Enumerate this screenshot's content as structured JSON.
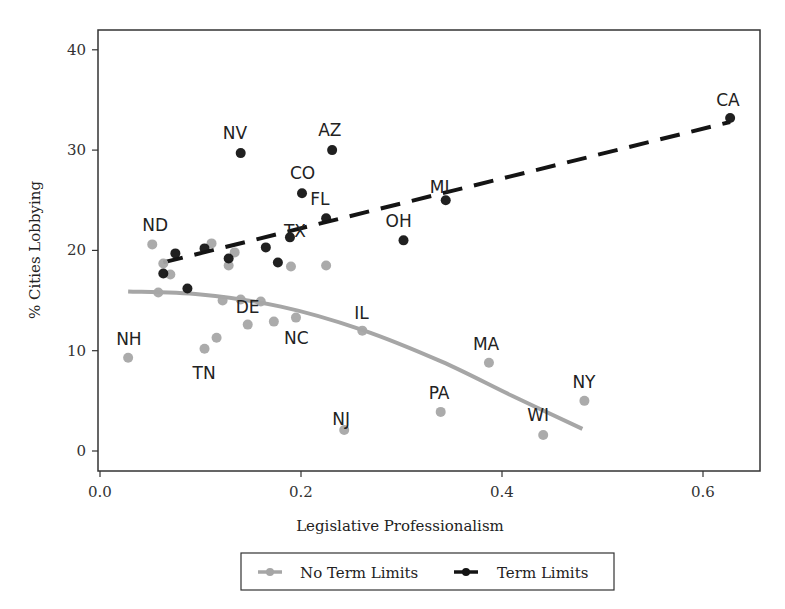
{
  "chart_data": {
    "type": "scatter",
    "title": "",
    "xlabel": "Legislative Professionalism",
    "ylabel": "% Cities Lobbying",
    "xlim": [
      -0.002,
      0.658
    ],
    "ylim": [
      -2,
      42
    ],
    "xticks": [
      0.0,
      0.2,
      0.4,
      0.6
    ],
    "xtick_labels": [
      "0.0",
      "0.2",
      "0.4",
      "0.6"
    ],
    "yticks": [
      0,
      10,
      20,
      30,
      40
    ],
    "ytick_labels": [
      "0",
      "10",
      "20",
      "30",
      "40"
    ],
    "grid": false,
    "legend_position": "bottom",
    "series": [
      {
        "name": "No Term Limits",
        "color": "#a6a6a6",
        "points": [
          {
            "x": 0.052,
            "y": 20.6,
            "label": "ND"
          },
          {
            "x": 0.063,
            "y": 18.7,
            "label": ""
          },
          {
            "x": 0.07,
            "y": 17.6,
            "label": ""
          },
          {
            "x": 0.058,
            "y": 15.8,
            "label": ""
          },
          {
            "x": 0.111,
            "y": 20.7,
            "label": ""
          },
          {
            "x": 0.134,
            "y": 19.8,
            "label": ""
          },
          {
            "x": 0.128,
            "y": 18.5,
            "label": ""
          },
          {
            "x": 0.19,
            "y": 18.4,
            "label": ""
          },
          {
            "x": 0.225,
            "y": 18.5,
            "label": ""
          },
          {
            "x": 0.122,
            "y": 15.0,
            "label": ""
          },
          {
            "x": 0.14,
            "y": 15.1,
            "label": ""
          },
          {
            "x": 0.16,
            "y": 14.9,
            "label": ""
          },
          {
            "x": 0.147,
            "y": 12.6,
            "label": "DE"
          },
          {
            "x": 0.173,
            "y": 12.9,
            "label": ""
          },
          {
            "x": 0.195,
            "y": 13.3,
            "label": "NC"
          },
          {
            "x": 0.116,
            "y": 11.3,
            "label": ""
          },
          {
            "x": 0.104,
            "y": 10.2,
            "label": "TN"
          },
          {
            "x": 0.028,
            "y": 9.3,
            "label": "NH"
          },
          {
            "x": 0.261,
            "y": 12.0,
            "label": "IL"
          },
          {
            "x": 0.387,
            "y": 8.8,
            "label": "MA"
          },
          {
            "x": 0.339,
            "y": 3.9,
            "label": "PA"
          },
          {
            "x": 0.243,
            "y": 2.1,
            "label": "NJ"
          },
          {
            "x": 0.482,
            "y": 5.0,
            "label": "NY"
          },
          {
            "x": 0.441,
            "y": 1.6,
            "label": "WI"
          }
        ],
        "fit": {
          "type": "quadratic",
          "style": "solid",
          "width": 4,
          "points": [
            [
              0.028,
              15.9
            ],
            [
              0.1,
              15.6
            ],
            [
              0.18,
              14.4
            ],
            [
              0.26,
              12.1
            ],
            [
              0.34,
              8.9
            ],
            [
              0.41,
              5.5
            ],
            [
              0.48,
              2.2
            ]
          ]
        }
      },
      {
        "name": "Term Limits",
        "color": "#141414",
        "points": [
          {
            "x": 0.627,
            "y": 33.2,
            "label": "CA"
          },
          {
            "x": 0.14,
            "y": 29.7,
            "label": "NV"
          },
          {
            "x": 0.231,
            "y": 30.0,
            "label": "AZ"
          },
          {
            "x": 0.201,
            "y": 25.7,
            "label": "CO"
          },
          {
            "x": 0.225,
            "y": 23.2,
            "label": "FL"
          },
          {
            "x": 0.344,
            "y": 25.0,
            "label": "MI"
          },
          {
            "x": 0.302,
            "y": 21.0,
            "label": "OH"
          },
          {
            "x": 0.189,
            "y": 21.3,
            "label": "TX"
          },
          {
            "x": 0.075,
            "y": 19.7,
            "label": ""
          },
          {
            "x": 0.063,
            "y": 17.7,
            "label": ""
          },
          {
            "x": 0.087,
            "y": 16.2,
            "label": ""
          },
          {
            "x": 0.104,
            "y": 20.2,
            "label": ""
          },
          {
            "x": 0.128,
            "y": 19.2,
            "label": ""
          },
          {
            "x": 0.165,
            "y": 20.3,
            "label": ""
          },
          {
            "x": 0.177,
            "y": 18.8,
            "label": ""
          }
        ],
        "fit": {
          "type": "linear",
          "style": "dashed",
          "width": 4,
          "points": [
            [
              0.063,
              18.8
            ],
            [
              0.627,
              32.8
            ]
          ]
        }
      }
    ],
    "label_offsets": {
      "ND": [
        -2,
        -13
      ],
      "DE": [
        -4,
        -12
      ],
      "NC": [
        -4,
        26
      ],
      "TN": [
        -4,
        30
      ],
      "NH": [
        -4,
        -13
      ],
      "IL": [
        0,
        -12
      ],
      "MA": [
        -8,
        -13
      ],
      "PA": [
        -4,
        -13
      ],
      "NJ": [
        -4,
        -5
      ],
      "NY": [
        -4,
        -13
      ],
      "WI": [
        -8,
        -14
      ],
      "CA": [
        -6,
        -12
      ],
      "NV": [
        -10,
        -14
      ],
      "AZ": [
        -6,
        -14
      ],
      "CO": [
        -4,
        -14
      ],
      "FL": [
        -8,
        -13
      ],
      "MI": [
        -8,
        -7
      ],
      "OH": [
        -10,
        -13
      ],
      "TX": [
        2,
        0
      ]
    }
  },
  "legend": {
    "items": [
      {
        "label": "No Term Limits",
        "color": "#a6a6a6"
      },
      {
        "label": "Term Limits",
        "color": "#141414"
      }
    ]
  }
}
